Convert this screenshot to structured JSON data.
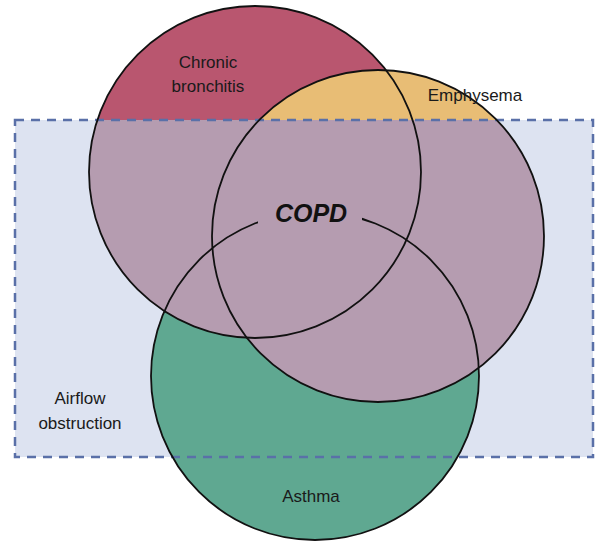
{
  "diagram": {
    "title": "COPD",
    "sets": [
      {
        "id": "chronic-bronchitis",
        "label_lines": [
          "Chronic",
          "bronchitis"
        ],
        "color": "#b9566f"
      },
      {
        "id": "emphysema",
        "label_lines": [
          "Emphysema"
        ],
        "color": "#e8bd75"
      },
      {
        "id": "asthma",
        "label_lines": [
          "Asthma"
        ],
        "color": "#5fa891"
      }
    ],
    "region": {
      "id": "airflow-obstruction",
      "label_lines": [
        "Airflow",
        "obstruction"
      ],
      "color": "#dde3f1",
      "border_color": "#5a70a8"
    },
    "overlap_color": "#b59cb0",
    "labels": {
      "copd": "COPD",
      "chronic": "Chronic",
      "bronchitis": "bronchitis",
      "emphysema": "Emphysema",
      "asthma": "Asthma",
      "airflow": "Airflow",
      "obstruction": "obstruction"
    }
  }
}
